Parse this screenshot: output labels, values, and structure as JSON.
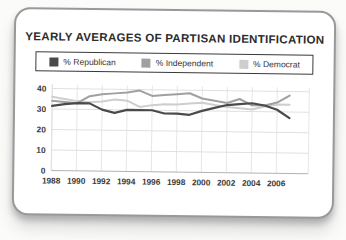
{
  "chart_data": {
    "type": "line",
    "title": "YEARLY AVERAGES OF PARTISAN IDENTIFICATION",
    "x": [
      1988,
      1989,
      1990,
      1991,
      1992,
      1993,
      1994,
      1995,
      1996,
      1997,
      1998,
      1999,
      2000,
      2001,
      2002,
      2003,
      2004,
      2005,
      2006,
      2007
    ],
    "series": [
      {
        "name": "% Republican",
        "color": "#4a4a4a",
        "values": [
          31.5,
          32.5,
          33,
          33,
          30,
          28.5,
          30,
          30,
          30,
          28.5,
          28.5,
          28,
          30,
          31.5,
          33,
          33.5,
          34,
          33,
          31,
          27
        ]
      },
      {
        "name": "% Independent",
        "color": "#a0a0a0",
        "values": [
          34,
          33.5,
          33,
          36.5,
          37.5,
          38,
          38.5,
          39.5,
          37,
          37.5,
          38,
          38.5,
          36,
          35,
          34,
          36,
          33,
          33,
          34.5,
          38
        ]
      },
      {
        "name": "% Democrat",
        "color": "#cecece",
        "values": [
          36,
          35,
          34,
          33.5,
          34,
          35,
          34.5,
          31.5,
          32.5,
          33,
          33,
          33.5,
          34,
          33,
          32,
          31.5,
          31,
          32.5,
          33.5,
          33.5
        ]
      }
    ],
    "xlabel": "",
    "ylabel": "",
    "ylim": [
      0,
      40
    ],
    "yticks": [
      0,
      10,
      20,
      30,
      40
    ],
    "xticks": [
      1988,
      1990,
      1992,
      1994,
      1996,
      1998,
      2000,
      2002,
      2004,
      2006
    ],
    "grid": true,
    "legend_position": "top"
  },
  "colors": {
    "grid": "#e0e0e0",
    "grid_vertical": "#e6e6e6",
    "axis": "#b3b3b3",
    "tick_text": "#3a3a3a",
    "card_border": "#98999b"
  }
}
